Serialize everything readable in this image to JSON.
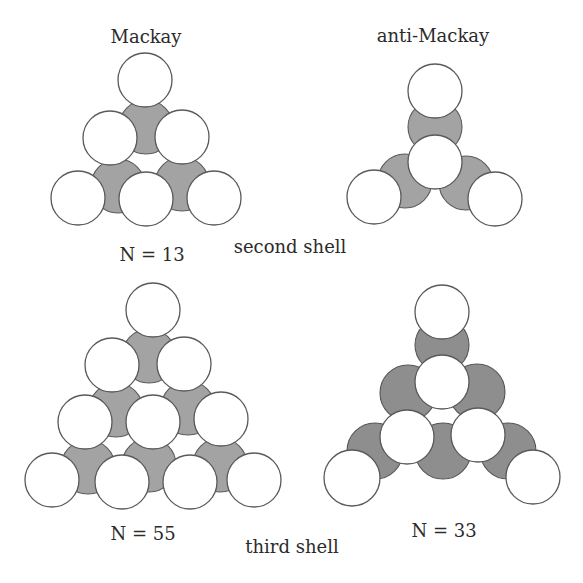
{
  "panels": [
    {
      "id": "mackay-second",
      "title": "Mackay",
      "count_label": "N = 13",
      "shell": "second",
      "outer_atoms": 6,
      "inner_atoms": 3
    },
    {
      "id": "anti-mackay-second",
      "title": "anti-Mackay",
      "count_label": "",
      "shell": "second",
      "outer_atoms": 4,
      "inner_atoms": 3
    },
    {
      "id": "mackay-third",
      "title": "",
      "count_label": "N = 55",
      "shell": "third",
      "outer_atoms": 10,
      "inner_atoms": 6
    },
    {
      "id": "anti-mackay-third",
      "title": "",
      "count_label": "N = 33",
      "shell": "third",
      "outer_atoms": 7,
      "inner_atoms": 6
    }
  ],
  "shell_labels": {
    "second": "second shell",
    "third": "third shell"
  },
  "colors": {
    "outer_atom": "#ffffff",
    "inner_atom": "#a3a3a3",
    "inner_atom_dark": "#8e8e8e",
    "outline": "#5a5a5a",
    "text": "#2b2b2b"
  }
}
